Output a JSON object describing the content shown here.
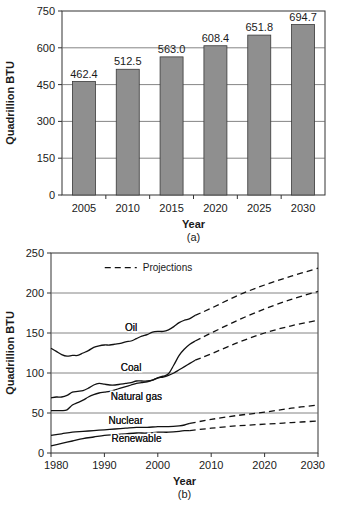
{
  "figure": {
    "panels": [
      {
        "id": "a",
        "caption": "(a)",
        "chart_ref": 0
      },
      {
        "id": "b",
        "caption": "(b)",
        "chart_ref": 1
      }
    ]
  },
  "chart_data": [
    {
      "type": "bar",
      "title": "",
      "xlabel": "Year",
      "ylabel": "Quadrillion BTU",
      "categories": [
        "2005",
        "2010",
        "2015",
        "2020",
        "2025",
        "2030"
      ],
      "values": [
        462.4,
        512.5,
        563.0,
        608.4,
        651.8,
        694.7
      ],
      "data_labels": [
        "462.4",
        "512.5",
        "563.0",
        "608.4",
        "651.8",
        "694.7"
      ],
      "ylim": [
        0,
        750
      ],
      "yticks": [
        0,
        150,
        300,
        450,
        600,
        750
      ],
      "ytick_labels": [
        "0",
        "150",
        "300",
        "450",
        "600",
        "750"
      ],
      "grid": true,
      "bar_color": "#8f8f8f",
      "bar_edge_color": "#3a3a3a",
      "legend": "none"
    },
    {
      "type": "line",
      "title": "",
      "xlabel": "Year",
      "ylabel": "Quadrillion BTU",
      "xlim": [
        1980,
        2030
      ],
      "ylim": [
        0,
        250
      ],
      "xticks": [
        1980,
        1990,
        2000,
        2010,
        2020,
        2030
      ],
      "xtick_labels": [
        "1980",
        "1990",
        "2000",
        "2010",
        "2020",
        "2030"
      ],
      "yticks": [
        0,
        50,
        100,
        150,
        200,
        250
      ],
      "ytick_labels": [
        "0",
        "50",
        "100",
        "150",
        "200",
        "250"
      ],
      "grid": true,
      "legend": {
        "position": "upper-center",
        "entries": [
          "Projections"
        ]
      },
      "projections_label": "Projections",
      "annotations": [
        {
          "text": "Oil",
          "x": 1995,
          "y": 152
        },
        {
          "text": "Coal",
          "x": 1995,
          "y": 103
        },
        {
          "text": "Natural gas",
          "x": 1996,
          "y": 66
        },
        {
          "text": "Nuclear",
          "x": 1994,
          "y": 36
        },
        {
          "text": "Renewable",
          "x": 1996,
          "y": 14
        }
      ],
      "series": [
        {
          "name": "Oil",
          "history": [
            [
              1980,
              131
            ],
            [
              1981,
              127
            ],
            [
              1982,
              123
            ],
            [
              1983,
              121
            ],
            [
              1984,
              122
            ],
            [
              1985,
              122
            ],
            [
              1986,
              125
            ],
            [
              1987,
              128
            ],
            [
              1988,
              132
            ],
            [
              1989,
              134
            ],
            [
              1990,
              135
            ],
            [
              1991,
              135
            ],
            [
              1992,
              136
            ],
            [
              1993,
              137
            ],
            [
              1994,
              139
            ],
            [
              1995,
              140
            ],
            [
              1996,
              143
            ],
            [
              1997,
              146
            ],
            [
              1998,
              148
            ],
            [
              1999,
              151
            ],
            [
              2000,
              152
            ],
            [
              2001,
              152
            ],
            [
              2002,
              154
            ],
            [
              2003,
              158
            ],
            [
              2004,
              163
            ],
            [
              2005,
              166
            ],
            [
              2006,
              168
            ],
            [
              2007,
              172
            ]
          ],
          "projection": [
            [
              2007,
              172
            ],
            [
              2010,
              181
            ],
            [
              2015,
              197
            ],
            [
              2020,
              210
            ],
            [
              2025,
              221
            ],
            [
              2030,
              231
            ]
          ]
        },
        {
          "name": "Coal",
          "history": [
            [
              1980,
              69
            ],
            [
              1981,
              70
            ],
            [
              1982,
              70
            ],
            [
              1983,
              72
            ],
            [
              1984,
              76
            ],
            [
              1985,
              77
            ],
            [
              1986,
              78
            ],
            [
              1987,
              81
            ],
            [
              1988,
              85
            ],
            [
              1989,
              87
            ],
            [
              1990,
              86
            ],
            [
              1991,
              85
            ],
            [
              1992,
              85
            ],
            [
              1993,
              86
            ],
            [
              1994,
              87
            ],
            [
              1995,
              88
            ],
            [
              1996,
              90
            ],
            [
              1997,
              90
            ],
            [
              1998,
              90
            ],
            [
              1999,
              91
            ],
            [
              2000,
              94
            ],
            [
              2001,
              96
            ],
            [
              2002,
              99
            ],
            [
              2003,
              110
            ],
            [
              2004,
              122
            ],
            [
              2005,
              130
            ],
            [
              2006,
              136
            ],
            [
              2007,
              140
            ]
          ],
          "projection": [
            [
              2007,
              140
            ],
            [
              2010,
              150
            ],
            [
              2015,
              166
            ],
            [
              2020,
              180
            ],
            [
              2025,
              192
            ],
            [
              2030,
              202
            ]
          ]
        },
        {
          "name": "Natural gas",
          "history": [
            [
              1980,
              53
            ],
            [
              1981,
              53
            ],
            [
              1982,
              53
            ],
            [
              1983,
              54
            ],
            [
              1984,
              60
            ],
            [
              1985,
              63
            ],
            [
              1986,
              66
            ],
            [
              1987,
              70
            ],
            [
              1988,
              73
            ],
            [
              1989,
              75
            ],
            [
              1990,
              76
            ],
            [
              1991,
              77
            ],
            [
              1992,
              79
            ],
            [
              1993,
              81
            ],
            [
              1994,
              83
            ],
            [
              1995,
              85
            ],
            [
              1996,
              87
            ],
            [
              1997,
              88
            ],
            [
              1998,
              89
            ],
            [
              1999,
              91
            ],
            [
              2000,
              94
            ],
            [
              2001,
              95
            ],
            [
              2002,
              97
            ],
            [
              2003,
              100
            ],
            [
              2004,
              104
            ],
            [
              2005,
              108
            ],
            [
              2006,
              112
            ],
            [
              2007,
              116
            ]
          ],
          "projection": [
            [
              2007,
              116
            ],
            [
              2010,
              124
            ],
            [
              2015,
              138
            ],
            [
              2020,
              150
            ],
            [
              2025,
              159
            ],
            [
              2030,
              166
            ]
          ]
        },
        {
          "name": "Nuclear",
          "history": [
            [
              1980,
              22
            ],
            [
              1982,
              24
            ],
            [
              1984,
              26
            ],
            [
              1986,
              27
            ],
            [
              1988,
              28
            ],
            [
              1990,
              29
            ],
            [
              1992,
              30
            ],
            [
              1994,
              31
            ],
            [
              1996,
              32
            ],
            [
              1998,
              32
            ],
            [
              2000,
              33
            ],
            [
              2002,
              33
            ],
            [
              2004,
              34
            ],
            [
              2005,
              35
            ],
            [
              2006,
              37
            ]
          ],
          "projection": [
            [
              2006,
              37
            ],
            [
              2010,
              42
            ],
            [
              2015,
              47
            ],
            [
              2020,
              51
            ],
            [
              2025,
              56
            ],
            [
              2030,
              60
            ]
          ]
        },
        {
          "name": "Renewable",
          "history": [
            [
              1980,
              9
            ],
            [
              1982,
              12
            ],
            [
              1984,
              15
            ],
            [
              1986,
              18
            ],
            [
              1988,
              20
            ],
            [
              1990,
              22
            ],
            [
              1992,
              23
            ],
            [
              1994,
              24
            ],
            [
              1996,
              25
            ],
            [
              1998,
              25
            ],
            [
              2000,
              26
            ],
            [
              2002,
              26
            ],
            [
              2004,
              27
            ],
            [
              2005,
              28
            ],
            [
              2006,
              28
            ]
          ],
          "projection": [
            [
              2006,
              28
            ],
            [
              2010,
              31
            ],
            [
              2015,
              34
            ],
            [
              2020,
              36
            ],
            [
              2025,
              38
            ],
            [
              2030,
              40
            ]
          ]
        }
      ]
    }
  ]
}
